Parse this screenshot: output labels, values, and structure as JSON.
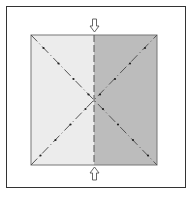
{
  "diagram": {
    "type": "origami-fold-step",
    "colors": {
      "left_half": "#ececec",
      "right_half": "#bcbcbc",
      "frame": "#333333",
      "crease": "#555555"
    },
    "elements": {
      "frame_label": "",
      "arrows": [
        {
          "position": "top",
          "direction": "down"
        },
        {
          "position": "bottom",
          "direction": "up"
        }
      ],
      "lines": [
        {
          "name": "diagonal-tl-br",
          "style": "dash-dot"
        },
        {
          "name": "diagonal-bl-tr",
          "style": "dash-dot"
        },
        {
          "name": "vertical-center",
          "style": "dashed"
        }
      ]
    }
  }
}
